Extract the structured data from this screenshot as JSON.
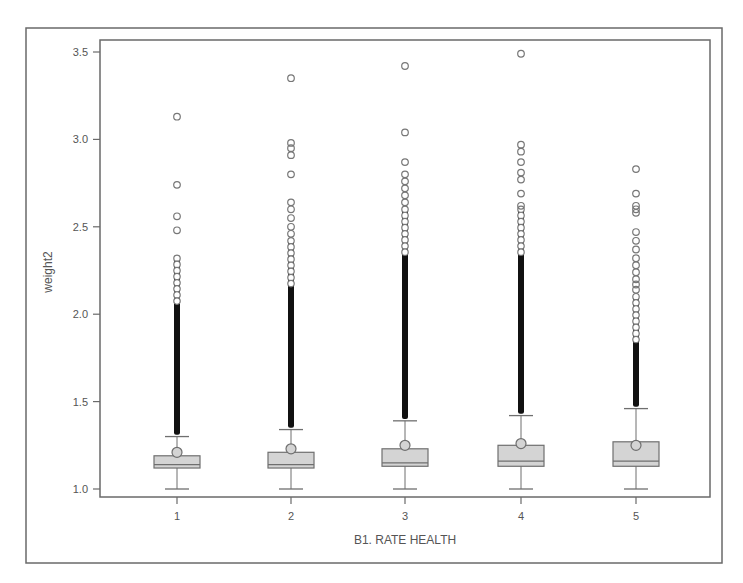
{
  "chart_data": {
    "type": "box",
    "title": "",
    "xlabel": "B1. RATE HEALTH",
    "ylabel": "weight2",
    "ylim": [
      1.0,
      3.5
    ],
    "yticks": [
      1.0,
      1.5,
      2.0,
      2.5,
      3.0,
      3.5
    ],
    "ytick_labels": [
      "1.0",
      "1.5",
      "2.0",
      "2.5",
      "3.0",
      "3.5"
    ],
    "categories": [
      "1",
      "2",
      "3",
      "4",
      "5"
    ],
    "grid": false,
    "legend": null,
    "series": [
      {
        "category": "1",
        "whisker_low": 1.0,
        "q1": 1.12,
        "median": 1.14,
        "q3": 1.19,
        "whisker_high": 1.3,
        "mean": 1.21,
        "dense_outlier_range": [
          1.31,
          2.32
        ],
        "outliers": [
          2.48,
          2.56,
          2.74,
          3.13
        ]
      },
      {
        "category": "2",
        "whisker_low": 1.0,
        "q1": 1.12,
        "median": 1.14,
        "q3": 1.21,
        "whisker_high": 1.34,
        "mean": 1.23,
        "dense_outlier_range": [
          1.35,
          2.42
        ],
        "outliers": [
          2.46,
          2.5,
          2.55,
          2.6,
          2.64,
          2.8,
          2.91,
          2.95,
          2.98,
          3.35
        ]
      },
      {
        "category": "3",
        "whisker_low": 1.0,
        "q1": 1.13,
        "median": 1.15,
        "q3": 1.23,
        "whisker_high": 1.39,
        "mean": 1.25,
        "dense_outlier_range": [
          1.4,
          2.6
        ],
        "outliers": [
          2.64,
          2.68,
          2.72,
          2.76,
          2.8,
          2.87,
          3.04,
          3.42
        ]
      },
      {
        "category": "4",
        "whisker_low": 1.0,
        "q1": 1.13,
        "median": 1.16,
        "q3": 1.25,
        "whisker_high": 1.42,
        "mean": 1.26,
        "dense_outlier_range": [
          1.43,
          2.6
        ],
        "outliers": [
          2.62,
          2.69,
          2.77,
          2.81,
          2.87,
          2.93,
          2.97,
          3.49
        ]
      },
      {
        "category": "5",
        "whisker_low": 1.0,
        "q1": 1.13,
        "median": 1.16,
        "q3": 1.27,
        "whisker_high": 1.46,
        "mean": 1.25,
        "dense_outlier_range": [
          1.47,
          2.1
        ],
        "outliers": [
          2.14,
          2.17,
          2.2,
          2.24,
          2.28,
          2.32,
          2.37,
          2.42,
          2.47,
          2.58,
          2.6,
          2.62,
          2.69,
          2.83
        ]
      }
    ]
  },
  "style": {
    "box_fill": "#d4d4d4",
    "box_stroke": "#6f6f6f",
    "frame_stroke": "#6a6a6a",
    "outlier_stroke": "#777777",
    "dense_color": "#111111",
    "text_color": "#555555"
  }
}
